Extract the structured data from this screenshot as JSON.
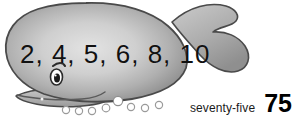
{
  "page": {
    "background_color": "#ffffff",
    "width": 298,
    "height": 120
  },
  "illustration": {
    "subject": "whale",
    "body_fill_light": "#d8d8d8",
    "body_fill_mid": "#b4b4b4",
    "body_fill_dark": "#8d8d8d",
    "outline_color": "#4a4a4a",
    "eye_white": "#ffffff",
    "eye_pupil": "#1a1a1a",
    "bubble_outline": "#9a9a9a",
    "bubble_fill": "#ffffff",
    "bubble_count": 8
  },
  "sequence": {
    "text": "2, 4, 5, 6, 8, 10",
    "numbers": [
      2,
      4,
      5,
      6,
      8,
      10
    ],
    "color": "#111111"
  },
  "answer": {
    "word": "seventy-five",
    "number": "75",
    "word_color": "#1a1a1a",
    "number_color": "#000000"
  }
}
